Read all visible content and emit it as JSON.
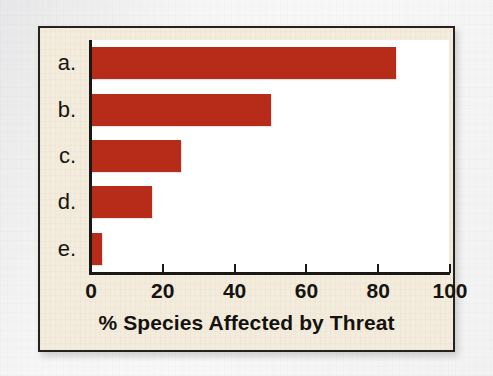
{
  "figure": {
    "frame_border_color": "#25211c",
    "frame_background_color": "#f3ecdd",
    "plot_background_color": "#ffffff",
    "page_background_color": "#f6f6f6"
  },
  "chart_data": {
    "type": "bar",
    "orientation": "horizontal",
    "title": "",
    "xlabel": "% Species Affected by Threat",
    "ylabel": "",
    "categories": [
      "a.",
      "b.",
      "c.",
      "d.",
      "e."
    ],
    "values": [
      85,
      50,
      25,
      17,
      3
    ],
    "xlim": [
      0,
      100
    ],
    "xticks": [
      0,
      20,
      40,
      60,
      80,
      100
    ],
    "xtick_labels": [
      "0",
      "20",
      "40",
      "60",
      "80",
      "100"
    ],
    "grid": false,
    "legend": null,
    "bar_color": "#b72b19",
    "axis_color": "#1a1715",
    "series": [
      {
        "name": "% Species Affected by Threat",
        "values": [
          85,
          50,
          25,
          17,
          3
        ]
      }
    ],
    "points": [
      {
        "category": "a.",
        "value": 85
      },
      {
        "category": "b.",
        "value": 50
      },
      {
        "category": "c.",
        "value": 25
      },
      {
        "category": "d.",
        "value": 17
      },
      {
        "category": "e.",
        "value": 3
      }
    ]
  }
}
